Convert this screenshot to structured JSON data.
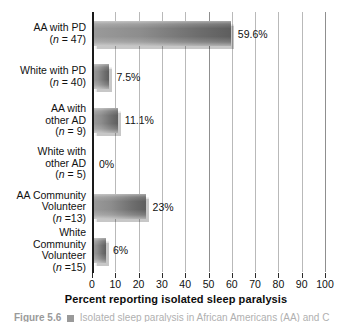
{
  "chart_data": {
    "type": "bar",
    "orientation": "horizontal",
    "title": "",
    "xlabel": "Percent reporting isolated sleep paralysis",
    "ylabel": "",
    "xlim": [
      0,
      100
    ],
    "xticks": [
      "0",
      "10",
      "20",
      "30",
      "40",
      "50",
      "60",
      "70",
      "80",
      "90",
      "100"
    ],
    "xtick_values": [
      0,
      10,
      20,
      30,
      40,
      50,
      60,
      70,
      80,
      90,
      100
    ],
    "grid": "vertical",
    "legend": "none",
    "categories": [
      "AA with PD (n = 47)",
      "White with PD (n = 40)",
      "AA with other AD (n = 9)",
      "White with other AD (n = 5)",
      "AA Community Volunteer (n =13)",
      "White Community Volunteer (n =15)"
    ],
    "values": [
      59.6,
      7.5,
      11.1,
      0,
      23,
      6
    ],
    "value_labels": [
      "59.6%",
      "7.5%",
      "11.1%",
      "0%",
      "23%",
      "6%"
    ],
    "bars": [
      {
        "label_lines": [
          "AA with PD"
        ],
        "n_line": "(n = 47)",
        "value": 59.6,
        "value_label": "59.6%"
      },
      {
        "label_lines": [
          "White with PD"
        ],
        "n_line": "(n = 40)",
        "value": 7.5,
        "value_label": "7.5%"
      },
      {
        "label_lines": [
          "AA with",
          "other AD"
        ],
        "n_line": "(n = 9)",
        "value": 11.1,
        "value_label": "11.1%"
      },
      {
        "label_lines": [
          "White with",
          "other AD"
        ],
        "n_line": "(n = 5)",
        "value": 0,
        "value_label": "0%"
      },
      {
        "label_lines": [
          "AA Community",
          "Volunteer"
        ],
        "n_line": "(n =13)",
        "value": 23,
        "value_label": "23%"
      },
      {
        "label_lines": [
          "White",
          "Community",
          "Volunteer"
        ],
        "n_line": "(n =15)",
        "value": 6,
        "value_label": "6%"
      }
    ],
    "colors": {
      "bar_light": "#9a9a9a",
      "bar_dark": "#5e5e5e",
      "gridline": "#b9b9b9",
      "axis": "#1a1a1a",
      "text": "#111111"
    }
  },
  "caption": {
    "figure_number": "Figure 5.6",
    "text": "Isolated sleep paralysis in African Americans (AA) and C"
  }
}
